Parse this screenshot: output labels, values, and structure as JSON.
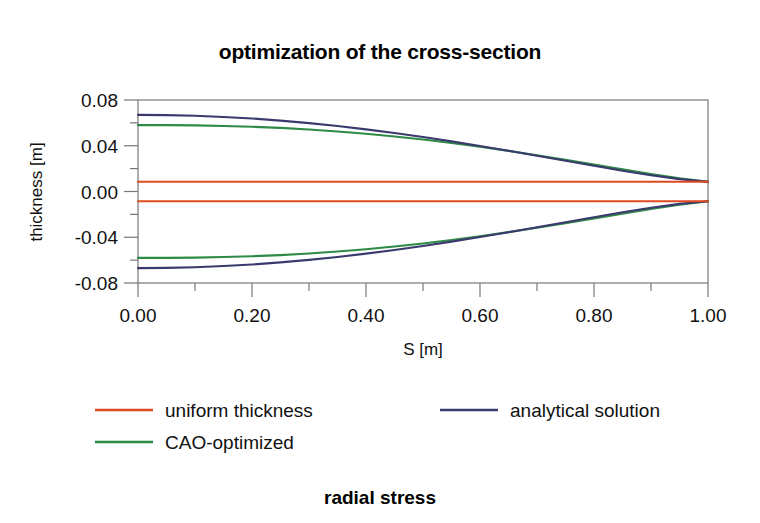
{
  "chart_data": {
    "type": "line",
    "title": "optimization of the cross-section",
    "caption": "radial stress",
    "xlabel": "S [m]",
    "ylabel": "thickness [m]",
    "xlim": [
      0.0,
      1.0
    ],
    "ylim": [
      -0.08,
      0.08
    ],
    "xticks": [
      "0.00",
      "0.20",
      "0.40",
      "0.60",
      "0.80",
      "1.00"
    ],
    "xtick_values": [
      0.0,
      0.2,
      0.4,
      0.6,
      0.8,
      1.0
    ],
    "xminor_values": [
      0.1,
      0.3,
      0.5,
      0.7,
      0.9
    ],
    "yticks": [
      "0.08",
      "0.04",
      "0.00",
      "-0.04",
      "-0.08"
    ],
    "ytick_values": [
      0.08,
      0.04,
      0.0,
      -0.04,
      -0.08
    ],
    "yminor_values": [
      0.06,
      0.02,
      -0.02,
      -0.06
    ],
    "grid": false,
    "legend_position": "below-axes",
    "x": [
      0.0,
      0.05,
      0.1,
      0.15,
      0.2,
      0.25,
      0.3,
      0.35,
      0.4,
      0.45,
      0.5,
      0.55,
      0.6,
      0.65,
      0.7,
      0.75,
      0.8,
      0.85,
      0.9,
      0.95,
      1.0
    ],
    "series": [
      {
        "name": "analytical solution",
        "color": "#3a3a6e",
        "upper": [
          0.067,
          0.0668,
          0.0662,
          0.0652,
          0.0638,
          0.062,
          0.0598,
          0.0572,
          0.0543,
          0.0511,
          0.0476,
          0.0438,
          0.0398,
          0.0356,
          0.0313,
          0.0269,
          0.0225,
          0.0182,
          0.0142,
          0.0108,
          0.0085
        ],
        "lower": [
          -0.067,
          -0.0668,
          -0.0662,
          -0.0652,
          -0.0638,
          -0.062,
          -0.0598,
          -0.0572,
          -0.0543,
          -0.0511,
          -0.0476,
          -0.0438,
          -0.0398,
          -0.0356,
          -0.0313,
          -0.0269,
          -0.0225,
          -0.0182,
          -0.0142,
          -0.0108,
          -0.0085
        ]
      },
      {
        "name": "CAO-optimized",
        "color": "#2e8b45",
        "upper": [
          0.058,
          0.058,
          0.0578,
          0.0573,
          0.0566,
          0.0556,
          0.0542,
          0.0525,
          0.0505,
          0.0481,
          0.0454,
          0.0424,
          0.0391,
          0.0355,
          0.0317,
          0.0277,
          0.0236,
          0.0194,
          0.0153,
          0.0115,
          0.0085
        ],
        "lower": [
          -0.058,
          -0.058,
          -0.0578,
          -0.0573,
          -0.0566,
          -0.0556,
          -0.0542,
          -0.0525,
          -0.0505,
          -0.0481,
          -0.0454,
          -0.0424,
          -0.0391,
          -0.0355,
          -0.0317,
          -0.0277,
          -0.0236,
          -0.0194,
          -0.0153,
          -0.0115,
          -0.0085
        ]
      },
      {
        "name": "uniform thickness",
        "color": "#e04a20",
        "upper": [
          0.0085,
          0.0085,
          0.0085,
          0.0085,
          0.0085,
          0.0085,
          0.0085,
          0.0085,
          0.0085,
          0.0085,
          0.0085,
          0.0085,
          0.0085,
          0.0085,
          0.0085,
          0.0085,
          0.0085,
          0.0085,
          0.0085,
          0.0085,
          0.0085
        ],
        "lower": [
          -0.0085,
          -0.0085,
          -0.0085,
          -0.0085,
          -0.0085,
          -0.0085,
          -0.0085,
          -0.0085,
          -0.0085,
          -0.0085,
          -0.0085,
          -0.0085,
          -0.0085,
          -0.0085,
          -0.0085,
          -0.0085,
          -0.0085,
          -0.0085,
          -0.0085,
          -0.0085,
          -0.0085
        ]
      }
    ],
    "legend": [
      {
        "label": "uniform thickness",
        "color": "#e04a20"
      },
      {
        "label": "analytical solution",
        "color": "#3a3a6e"
      },
      {
        "label": "CAO-optimized",
        "color": "#2e8b45"
      }
    ]
  },
  "colors": {
    "uniform_thickness": "#e04a20",
    "analytical_solution": "#3a3a6e",
    "cao_optimized": "#2e8b45",
    "axis": "#777777",
    "text": "#111111",
    "background": "#ffffff"
  }
}
